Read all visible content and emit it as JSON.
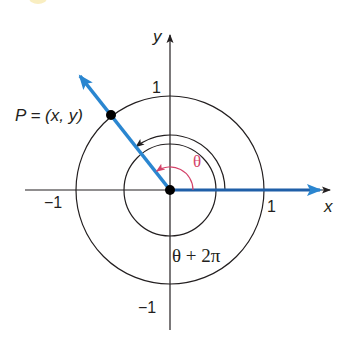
{
  "diagram": {
    "type": "unit-circle-angle",
    "colors": {
      "ink": "#231f20",
      "ray_blue": "#2a86d0",
      "axis_blue": "#1f5fa8",
      "theta_red": "#d4436a",
      "corner_yellow": "#f6e7a6"
    },
    "axes": {
      "x_label": "x",
      "y_label": "y",
      "ticks": {
        "x_pos": "1",
        "x_neg": "−1",
        "y_pos": "1",
        "y_neg": "−1"
      }
    },
    "point": {
      "label": "P = (x, y)"
    },
    "angles": {
      "theta_label": "θ",
      "coterminal_label": "θ + 2π"
    }
  }
}
